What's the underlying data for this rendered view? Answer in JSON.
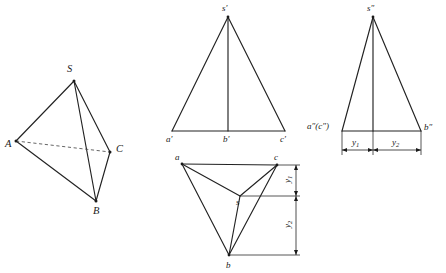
{
  "figure": {
    "background_color": "#ffffff",
    "line_color": "#222222",
    "dashed_line_color": "#555555",
    "views": [
      {
        "id": "pictorial",
        "name": "pictorial-view",
        "labels": {
          "apex": "S",
          "left": "A",
          "right": "C",
          "bottom": "B"
        }
      },
      {
        "id": "front",
        "name": "front-view",
        "labels": {
          "apex": "s",
          "apex_prime": "′",
          "left": "a",
          "left_prime": "′",
          "middle": "b",
          "middle_prime": "′",
          "right": "c",
          "right_prime": "′"
        },
        "label_apex_full": "s′",
        "label_left_full": "a′",
        "label_middle_full": "b′",
        "label_right_full": "c′"
      },
      {
        "id": "side",
        "name": "side-view",
        "label_apex_full": "s″",
        "label_left_full": "a″(c″)",
        "label_right_full": "b″",
        "dimensions": [
          {
            "name": "y1",
            "base": "y",
            "sub": "1"
          },
          {
            "name": "y2",
            "base": "y",
            "sub": "2"
          }
        ]
      },
      {
        "id": "top",
        "name": "top-view",
        "label_left": "a",
        "label_right": "c",
        "label_center": "s",
        "label_bottom": "b",
        "dimensions": [
          {
            "name": "y1",
            "base": "y",
            "sub": "1"
          },
          {
            "name": "y2",
            "base": "y",
            "sub": "2"
          }
        ]
      }
    ]
  }
}
